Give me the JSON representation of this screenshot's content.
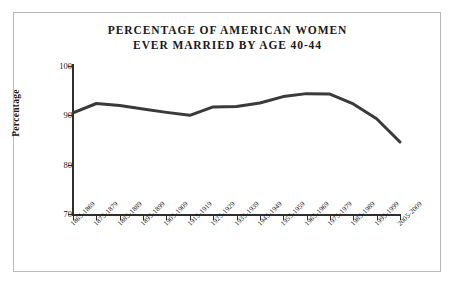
{
  "figure": {
    "background_color": "#ffffff",
    "border_color": "#b9b9b9"
  },
  "chart_data": {
    "type": "line",
    "title": "PERCENTAGE OF AMERICAN WOMEN EVER MARRIED BY AGE 40-44",
    "title_line1": "PERCENTAGE OF AMERICAN WOMEN",
    "title_line2": "EVER MARRIED BY AGE 40-44",
    "xlabel": "",
    "ylabel": "Percentage",
    "ylim": [
      70,
      100
    ],
    "yticks": [
      70,
      80,
      90,
      100
    ],
    "grid": false,
    "legend": "none",
    "line_color": "#3a3a3a",
    "line_width": 3,
    "categories": [
      "1865-1869",
      "1875-1879",
      "1885-1889",
      "1895-1899",
      "1905-1909",
      "1915-1919",
      "1925-1929",
      "1935-1939",
      "1945-1949",
      "1955-1959",
      "1965-1969",
      "1975-1979",
      "1985-1989",
      "1995-1999",
      "2005-2009"
    ],
    "values": [
      90.5,
      92.4,
      92.0,
      91.3,
      90.6,
      90.0,
      91.7,
      91.8,
      92.5,
      93.8,
      94.4,
      94.3,
      92.3,
      89.3,
      84.6
    ]
  }
}
